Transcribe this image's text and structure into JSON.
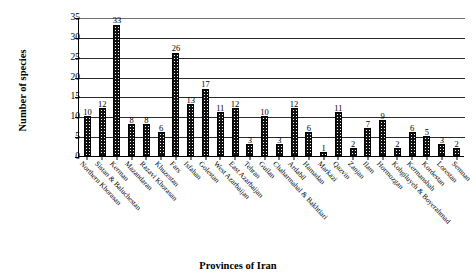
{
  "chart_data": {
    "type": "bar",
    "title": "",
    "xlabel": "Provinces of Iran",
    "ylabel": "Number of species",
    "ylim": [
      0,
      35
    ],
    "ytick_step": 5,
    "yticks": [
      0,
      5,
      10,
      15,
      20,
      25,
      30,
      35
    ],
    "grid": true,
    "legend": "none",
    "bar_color": "#111111",
    "bar_pattern": "dotted-fill",
    "categories": [
      "Northern Khorasan",
      "Sistan & Baluchestan",
      "Kerman",
      "Mazandaran",
      "Razavi Khorasan",
      "Khuzestan",
      "Fars",
      "Isfahan",
      "Golestan",
      "West Azarbaijan",
      "East Azarbaijan",
      "Tehran",
      "Guilan",
      "Chaharmahal & Bakhtiari",
      "Ardabil",
      "Hamadan",
      "Markazi",
      "Qazvin",
      "Zanjan",
      "Ilam",
      "Hormozgan",
      "Kohgiluyeh & Boyerahmad",
      "Kermanshah",
      "Kordestan",
      "Lorestan",
      "Semnan"
    ],
    "values": [
      10,
      12,
      33,
      8,
      8,
      6,
      26,
      13,
      17,
      11,
      12,
      3,
      10,
      3,
      12,
      6,
      1,
      11,
      2,
      7,
      9,
      2,
      6,
      5,
      3,
      2
    ],
    "value_labels": [
      "10",
      "12",
      "33",
      "8",
      "8",
      "6",
      "26",
      "13",
      "17",
      "11",
      "12",
      "3",
      "10",
      "3",
      "12",
      "6",
      "1",
      "11",
      "2",
      "7",
      "9",
      "2",
      "6",
      "5",
      "3",
      "2"
    ]
  },
  "axis": {
    "y_title": "Number of species",
    "x_title": "Provinces of Iran"
  }
}
